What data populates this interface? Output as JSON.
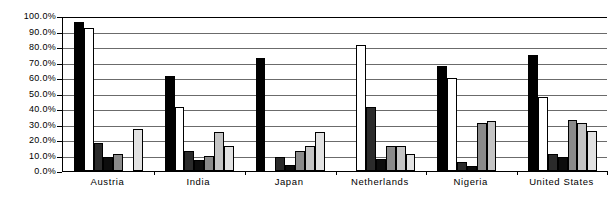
{
  "chart_data": {
    "type": "bar",
    "title": "",
    "subtitle": "",
    "xlabel": "",
    "ylabel": "",
    "ylim": [
      0,
      100
    ],
    "grid": true,
    "legend_position": "none",
    "y_tick_labels": [
      "100.0%",
      "90.0%",
      "80.0%",
      "70.0%",
      "60.0%",
      "50.0%",
      "40.0%",
      "30.0%",
      "20.0%",
      "10.0%",
      "0.0%"
    ],
    "y_tick_values": [
      100,
      90,
      80,
      70,
      60,
      50,
      40,
      30,
      20,
      10,
      0
    ],
    "categories": [
      "Austria",
      "India",
      "Japan",
      "Netherlands",
      "Nigeria",
      "United States"
    ],
    "series": [
      {
        "name": "Series 1",
        "color": "#000000",
        "values": [
          96.0,
          61.0,
          73.0,
          0.0,
          68.0,
          75.0
        ]
      },
      {
        "name": "Series 2",
        "color": "#ffffff",
        "values": [
          92.0,
          41.0,
          0.0,
          81.0,
          60.0,
          48.0
        ]
      },
      {
        "name": "Series 3",
        "color": "#2b2b2b",
        "values": [
          18.0,
          13.0,
          9.0,
          41.0,
          6.0,
          11.0
        ]
      },
      {
        "name": "Series 4",
        "color": "#0d0d0d",
        "values": [
          9.0,
          7.0,
          4.0,
          8.0,
          3.0,
          9.0
        ]
      },
      {
        "name": "Series 5",
        "color": "#8a8a8a",
        "values": [
          11.0,
          10.0,
          13.0,
          16.0,
          31.0,
          33.0
        ]
      },
      {
        "name": "Series 6",
        "color": "#c4c4c4",
        "values": [
          0.0,
          25.0,
          16.0,
          16.0,
          32.0,
          31.0
        ]
      },
      {
        "name": "Series 7",
        "color": "#e2e2e2",
        "values": [
          27.0,
          16.0,
          25.0,
          11.0,
          0.0,
          26.0
        ]
      }
    ]
  }
}
